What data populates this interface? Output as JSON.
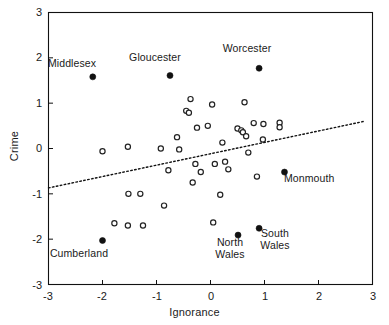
{
  "chart_data": {
    "type": "scatter",
    "title": "",
    "xlabel": "Ignorance",
    "ylabel": "Crime",
    "xlim": [
      -3,
      3
    ],
    "ylim": [
      -3,
      3
    ],
    "xticks": [
      -3,
      -2,
      -1,
      0,
      1,
      2,
      3
    ],
    "yticks": [
      -3,
      -2,
      -1,
      0,
      1,
      2,
      3
    ],
    "xticklabels": [
      "-3",
      "-2",
      "-1",
      "0",
      "1",
      "2",
      "3"
    ],
    "yticklabels": [
      "-3",
      "-2",
      "-1",
      "0",
      "1",
      "2",
      "3"
    ],
    "grid": false,
    "legend": null,
    "series": [
      {
        "name": "unlabelled counties",
        "marker": "open-circle",
        "points": [
          {
            "x": -2.0,
            "y": -0.06
          },
          {
            "x": -1.53,
            "y": 0.04
          },
          {
            "x": -1.52,
            "y": -1.0
          },
          {
            "x": -1.3,
            "y": -1.0
          },
          {
            "x": -1.53,
            "y": -1.7
          },
          {
            "x": -1.25,
            "y": -1.7
          },
          {
            "x": -1.78,
            "y": -1.65
          },
          {
            "x": -0.92,
            "y": 0.0
          },
          {
            "x": -0.86,
            "y": -1.26
          },
          {
            "x": -0.78,
            "y": -0.48
          },
          {
            "x": -0.62,
            "y": 0.25
          },
          {
            "x": -0.58,
            "y": -0.02
          },
          {
            "x": -0.45,
            "y": 0.83
          },
          {
            "x": -0.4,
            "y": 0.79
          },
          {
            "x": -0.37,
            "y": 1.09
          },
          {
            "x": -0.33,
            "y": -0.75
          },
          {
            "x": -0.28,
            "y": -0.34
          },
          {
            "x": -0.25,
            "y": 0.46
          },
          {
            "x": -0.18,
            "y": -0.52
          },
          {
            "x": -0.05,
            "y": 0.5
          },
          {
            "x": 0.03,
            "y": 0.97
          },
          {
            "x": 0.05,
            "y": -1.63
          },
          {
            "x": 0.08,
            "y": -0.34
          },
          {
            "x": 0.18,
            "y": -1.02
          },
          {
            "x": 0.22,
            "y": 0.13
          },
          {
            "x": 0.27,
            "y": -0.29
          },
          {
            "x": 0.33,
            "y": -0.46
          },
          {
            "x": 0.5,
            "y": 0.44
          },
          {
            "x": 0.57,
            "y": 0.4
          },
          {
            "x": 0.6,
            "y": 0.36
          },
          {
            "x": 0.63,
            "y": 1.02
          },
          {
            "x": 0.66,
            "y": 0.27
          },
          {
            "x": 0.7,
            "y": -0.09
          },
          {
            "x": 0.8,
            "y": 0.56
          },
          {
            "x": 0.86,
            "y": -0.62
          },
          {
            "x": 0.98,
            "y": 0.54
          },
          {
            "x": 0.97,
            "y": 0.2
          },
          {
            "x": 1.28,
            "y": 0.57
          },
          {
            "x": 1.28,
            "y": 0.47
          }
        ]
      },
      {
        "name": "labelled counties",
        "marker": "filled-circle",
        "points": [
          {
            "x": -2.18,
            "y": 1.58,
            "label": "Middlesex",
            "label_pos": "above"
          },
          {
            "x": -0.75,
            "y": 1.61,
            "label": "Gloucester",
            "label_pos": "above"
          },
          {
            "x": 0.9,
            "y": 1.77,
            "label": "Worcester",
            "label_pos": "above"
          },
          {
            "x": 1.37,
            "y": -0.52,
            "label": "Monmouth",
            "label_pos": "right-below"
          },
          {
            "x": -2.0,
            "y": -2.03,
            "label": "Cumberland",
            "label_pos": "below"
          },
          {
            "x": 0.51,
            "y": -1.91,
            "label": "North\nWales",
            "label_pos": "below"
          },
          {
            "x": 0.9,
            "y": -1.76,
            "label": "South\nWales",
            "label_pos": "below"
          }
        ]
      }
    ],
    "trendline": {
      "style": "dotted",
      "x_start": -3.0,
      "y_start": -0.87,
      "x_end": 2.85,
      "y_end": 0.6
    }
  }
}
